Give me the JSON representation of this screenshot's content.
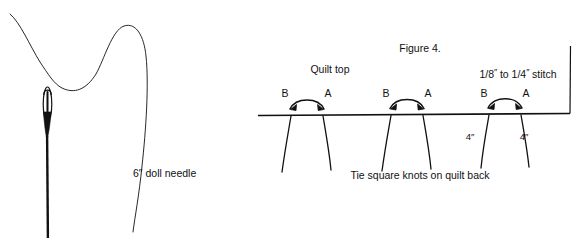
{
  "figure": {
    "caption_top": "Figure 4.",
    "left_panel": {
      "needle_label": "6″ doll needle"
    },
    "right_panel": {
      "quilt_top_label": "Quilt top",
      "stitch_size_label": {
        "num1": "1",
        "den1": "8",
        "mid": "to",
        "num2": "1",
        "den2": "4",
        "suffix": "stitch",
        "inch_mark": "″"
      },
      "bottom_caption": "Tie square knots on quilt back",
      "stitch_groups": [
        {
          "point_b": "B",
          "point_a": "A"
        },
        {
          "point_b": "B",
          "point_a": "A"
        },
        {
          "point_b": "B",
          "point_a": "A"
        }
      ],
      "spacing_labels": [
        "4″",
        "4″"
      ]
    },
    "colors": {
      "ink": "#111111",
      "background": "#ffffff"
    }
  }
}
